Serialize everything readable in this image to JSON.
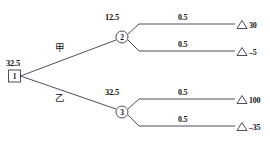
{
  "diagram": {
    "type": "decision-tree",
    "title": "",
    "root": {
      "node_id": "1",
      "node_shape": "square",
      "value": "32.5"
    },
    "branches": [
      {
        "label": "甲",
        "target_node": {
          "node_id": "2",
          "node_shape": "circle",
          "value": "12.5"
        },
        "outcomes": [
          {
            "probability": "0.5",
            "payoff": "30",
            "marker": "triangle"
          },
          {
            "probability": "0.5",
            "payoff": "–5",
            "marker": "triangle"
          }
        ]
      },
      {
        "label": "乙",
        "target_node": {
          "node_id": "3",
          "node_shape": "circle",
          "value": "32.5"
        },
        "outcomes": [
          {
            "probability": "0.5",
            "payoff": "100",
            "marker": "triangle"
          },
          {
            "probability": "0.5",
            "payoff": "–35",
            "marker": "triangle"
          }
        ]
      }
    ],
    "colors": {
      "line": "#3a3a4a",
      "text": "#141414",
      "background": "#ffffff"
    }
  }
}
